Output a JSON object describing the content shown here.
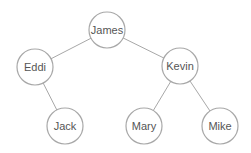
{
  "diagram": {
    "type": "tree",
    "nodes": [
      {
        "id": "james",
        "label": "James",
        "x": 107,
        "y": 30
      },
      {
        "id": "eddi",
        "label": "Eddi",
        "x": 35,
        "y": 67
      },
      {
        "id": "kevin",
        "label": "Kevin",
        "x": 180,
        "y": 66
      },
      {
        "id": "jack",
        "label": "Jack",
        "x": 65,
        "y": 126
      },
      {
        "id": "mary",
        "label": "Mary",
        "x": 144,
        "y": 126
      },
      {
        "id": "mike",
        "label": "Mike",
        "x": 220,
        "y": 126
      }
    ],
    "edges": [
      {
        "from": "james",
        "to": "eddi"
      },
      {
        "from": "james",
        "to": "kevin"
      },
      {
        "from": "eddi",
        "to": "jack"
      },
      {
        "from": "kevin",
        "to": "mary"
      },
      {
        "from": "kevin",
        "to": "mike"
      }
    ],
    "node_radius": 18,
    "stroke_color": "#a8a8a8",
    "text_color": "#555555"
  }
}
